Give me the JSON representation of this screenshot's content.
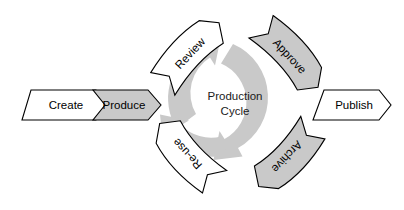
{
  "diagram": {
    "title": "Production Cycle",
    "center_label_line1": "Production",
    "center_label_line2": "Cycle",
    "colors": {
      "gray_fill": "#c9c9c9",
      "white_fill": "#ffffff",
      "outline": "#000000",
      "cycle_arrow": "#c9c9c9",
      "background": "#ffffff"
    },
    "stages": [
      {
        "id": "create",
        "label": "Create",
        "fill": "white",
        "shape": "chevron",
        "position": "left-outer",
        "rotation_deg": 0
      },
      {
        "id": "produce",
        "label": "Produce",
        "fill": "gray",
        "shape": "chevron",
        "position": "left-inner",
        "rotation_deg": 0
      },
      {
        "id": "review",
        "label": "Review",
        "fill": "white",
        "shape": "curved-chevron",
        "position": "upper-left",
        "rotation_deg": -45
      },
      {
        "id": "approve",
        "label": "Approve",
        "fill": "gray",
        "shape": "curved-chevron",
        "position": "upper-right",
        "rotation_deg": 45
      },
      {
        "id": "publish",
        "label": "Publish",
        "fill": "white",
        "shape": "chevron",
        "position": "right-outer",
        "rotation_deg": 0
      },
      {
        "id": "archive",
        "label": "Archive",
        "fill": "gray",
        "shape": "curved-chevron",
        "position": "lower-right",
        "rotation_deg": 135
      },
      {
        "id": "re-use",
        "label": "Re-use",
        "fill": "white",
        "shape": "curved-chevron",
        "position": "lower-left",
        "rotation_deg": -135
      }
    ],
    "cycle_arrows": {
      "count": 3,
      "direction": "clockwise",
      "color": "#c9c9c9",
      "description": "three thick gray circular arrow segments forming a ring around the center label"
    }
  }
}
